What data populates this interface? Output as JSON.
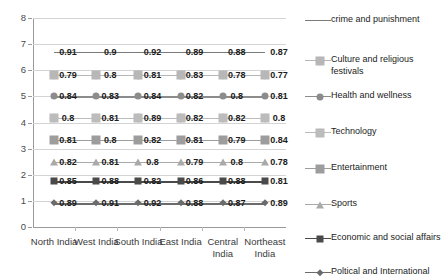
{
  "chart_data": {
    "type": "line",
    "title": "",
    "xlabel": "",
    "ylabel": "",
    "ylim": [
      0,
      8
    ],
    "yticks": [
      0,
      1,
      2,
      3,
      4,
      5,
      6,
      7,
      8
    ],
    "grid": true,
    "legend_position": "right",
    "note": "Each series is drawn on its own fixed baseline row; the plotted point labels carry the actual values.",
    "categories": [
      "North India",
      "West India",
      "South India",
      "East India",
      "Central India",
      "Northeast India"
    ],
    "series": [
      {
        "name": "crime and punishment",
        "values": [
          0.91,
          0.9,
          0.92,
          0.89,
          0.88,
          0.87
        ],
        "baseline": 6.7,
        "color": "#7a7a7a",
        "marker": "none"
      },
      {
        "name": "Culture and religious festivals",
        "values": [
          0.79,
          0.8,
          0.81,
          0.83,
          0.78,
          0.77
        ],
        "baseline": 5.82,
        "color": "#b7b7b7",
        "marker": "plus"
      },
      {
        "name": "Health and wellness",
        "values": [
          0.84,
          0.83,
          0.84,
          0.82,
          0.8,
          0.81
        ],
        "baseline": 5.0,
        "color": "#8c8c8c",
        "marker": "circle"
      },
      {
        "name": "Technology",
        "values": [
          0.8,
          0.81,
          0.89,
          0.82,
          0.82,
          0.8
        ],
        "baseline": 4.17,
        "color": "#bcbcbc",
        "marker": "plus"
      },
      {
        "name": "Entertainment",
        "values": [
          0.81,
          0.8,
          0.82,
          0.81,
          0.79,
          0.84
        ],
        "baseline": 3.34,
        "color": "#9d9d9d",
        "marker": "cross"
      },
      {
        "name": "Sports",
        "values": [
          0.82,
          0.81,
          0.8,
          0.79,
          0.8,
          0.78
        ],
        "baseline": 2.5,
        "color": "#a9a9a9",
        "marker": "triangle"
      },
      {
        "name": "Economic and social affairs",
        "values": [
          0.85,
          0.88,
          0.82,
          0.86,
          0.88,
          0.81
        ],
        "baseline": 1.75,
        "color": "#4a4a4a",
        "marker": "square"
      },
      {
        "name": "Poltical and International",
        "values": [
          0.89,
          0.91,
          0.92,
          0.88,
          0.87,
          0.89
        ],
        "baseline": 0.9,
        "color": "#6b6b6b",
        "marker": "diamond"
      }
    ]
  },
  "axis": {
    "y_tick_labels": [
      "8",
      "7",
      "6",
      "5",
      "4",
      "3",
      "2",
      "1",
      "0"
    ],
    "x_tick_labels": [
      "North India",
      "West India",
      "South India",
      "East India",
      "Central India",
      "Northeast India"
    ]
  },
  "colors": {
    "gridline": "#d4d4d4",
    "axis": "#9a9a9a",
    "text": "#1b1b1b",
    "background": "#ffffff"
  }
}
